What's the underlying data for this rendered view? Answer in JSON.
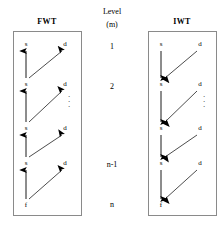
{
  "figure": {
    "type": "diagram"
  },
  "panels": {
    "left": {
      "title": "FWT",
      "arrow_direction_vertical": "up",
      "arrow_direction_diagonal": "up-right",
      "ellipsis": "⋮"
    },
    "right": {
      "title": "IWT",
      "arrow_direction_vertical": "down",
      "arrow_direction_diagonal": "down-left",
      "ellipsis": "⋮"
    }
  },
  "center": {
    "heading_line1": "Level",
    "heading_line2": "(m)",
    "levels": [
      {
        "label": "1"
      },
      {
        "label": "2"
      },
      {
        "label": "n-1"
      },
      {
        "label": "n"
      }
    ]
  },
  "nodes": {
    "approx_label": "s",
    "detail_label": "d",
    "signal_label": "f"
  },
  "rows": [
    {
      "s": "s",
      "d": "d"
    },
    {
      "s": "s",
      "d": "d"
    },
    {
      "s": "s",
      "d": "d"
    },
    {
      "s": "s",
      "d": "d"
    },
    {
      "s": "f",
      "d": ""
    }
  ],
  "colors": {
    "stroke": "#000000",
    "border": "#8a8a8a",
    "background": "#ffffff"
  }
}
